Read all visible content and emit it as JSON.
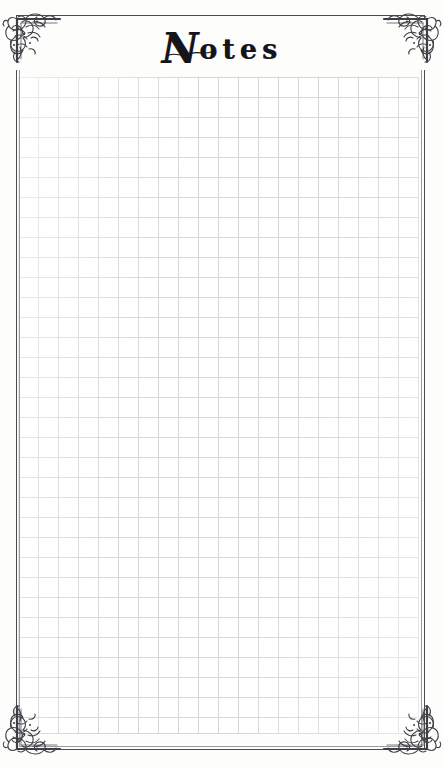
{
  "page": {
    "title": "Notes",
    "title_initial": "N",
    "title_rest": "otes",
    "background_color": "#fdfdfc",
    "ink_color": "#14141a",
    "frame_color": "#4a4a4f",
    "grid_line_color": "#d5d7dc",
    "grid_cell_size": "20px"
  },
  "ornaments": {
    "top_left": "corner-flourish-ornament",
    "top_right": "corner-flourish-ornament",
    "bottom_left": "corner-flourish-ornament",
    "bottom_right": "corner-flourish-ornament"
  },
  "grid": {
    "label": "graph-paper-grid",
    "columns": 20,
    "rows": 33
  }
}
